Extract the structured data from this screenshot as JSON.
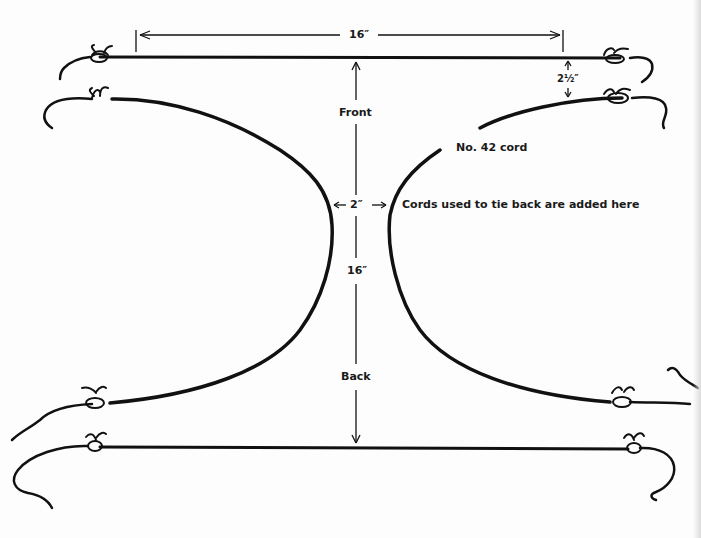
{
  "diagram": {
    "type": "pattern-diagram",
    "labels": {
      "top_width": "16″",
      "spacing": "2½″",
      "front": "Front",
      "cord": "No. 42 cord",
      "gap": "2″",
      "tie_note": "Cords used to tie back are added here",
      "length": "16″",
      "back": "Back"
    },
    "elements": [
      {
        "id": "top-cord",
        "kind": "straight cord with knotted ends"
      },
      {
        "id": "front-left-curve",
        "kind": "curved cord"
      },
      {
        "id": "front-right-curve",
        "kind": "curved cord"
      },
      {
        "id": "bottom-cord",
        "kind": "straight cord with knotted ends"
      }
    ],
    "colors": {
      "ink": "#111111",
      "paper": "#fdfdfd"
    }
  }
}
